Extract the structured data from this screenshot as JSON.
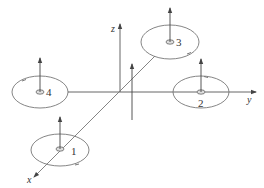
{
  "diagram": {
    "type": "quadrotor-coordinate-frame",
    "colors": {
      "stroke": "#555555",
      "rotor": "#777777",
      "text": "#333333",
      "background": "#ffffff"
    },
    "axes": [
      {
        "name": "x",
        "label": "x"
      },
      {
        "name": "y",
        "label": "y"
      },
      {
        "name": "z",
        "label": "z"
      }
    ],
    "rotors": [
      {
        "id": "1",
        "label": "1"
      },
      {
        "id": "2",
        "label": "2"
      },
      {
        "id": "3",
        "label": "3"
      },
      {
        "id": "4",
        "label": "4"
      }
    ]
  }
}
